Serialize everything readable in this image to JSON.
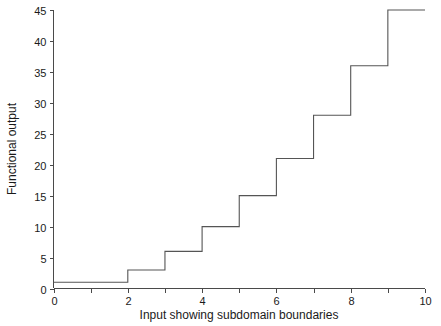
{
  "chart_data": {
    "type": "line",
    "subtype": "step-post",
    "title": "",
    "xlabel": "Input showing subdomain boundaries",
    "ylabel": "Functional output",
    "xlim": [
      0,
      10
    ],
    "ylim": [
      0,
      45
    ],
    "grid": false,
    "legend": null,
    "x_ticks": [
      0,
      1,
      2,
      3,
      4,
      5,
      6,
      7,
      8,
      9,
      10
    ],
    "x_tick_labels": [
      "0",
      "",
      "2",
      "",
      "4",
      "",
      "6",
      "",
      "8",
      "",
      "10"
    ],
    "y_ticks": [
      0,
      5,
      10,
      15,
      20,
      25,
      30,
      35,
      40,
      45
    ],
    "y_tick_labels": [
      "0",
      "5",
      "10",
      "15",
      "20",
      "25",
      "30",
      "35",
      "40",
      "45"
    ],
    "line_color": "#555555",
    "axis_color": "#4a4a4a",
    "background_color": "#ffffff",
    "steps": [
      {
        "x_start": 0,
        "x_end": 2,
        "value": 1
      },
      {
        "x_start": 2,
        "x_end": 3,
        "value": 3
      },
      {
        "x_start": 3,
        "x_end": 4,
        "value": 6
      },
      {
        "x_start": 4,
        "x_end": 5,
        "value": 10
      },
      {
        "x_start": 5,
        "x_end": 6,
        "value": 15
      },
      {
        "x_start": 6,
        "x_end": 7,
        "value": 21
      },
      {
        "x_start": 7,
        "x_end": 8,
        "value": 28
      },
      {
        "x_start": 8,
        "x_end": 9,
        "value": 36
      },
      {
        "x_start": 9,
        "x_end": 10,
        "value": 45
      }
    ],
    "x": [
      0,
      2,
      3,
      4,
      5,
      6,
      7,
      8,
      9,
      10
    ],
    "values": [
      1,
      3,
      6,
      10,
      15,
      21,
      28,
      36,
      45,
      45
    ]
  },
  "axis": {
    "x_title": "Input showing subdomain boundaries",
    "y_title": "Functional output"
  }
}
